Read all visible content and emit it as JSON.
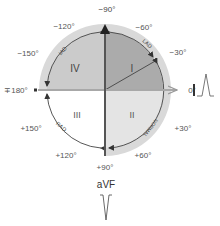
{
  "diagram": {
    "center": {
      "x": 105,
      "y": 90
    },
    "radii": {
      "outer": 66,
      "arc": 58
    },
    "colors": {
      "outer_ring": "#d9d9d9",
      "quadrant_I": "#ababab",
      "quadrant_II": "#e4e4e4",
      "quadrant_III": "#ffffff",
      "quadrant_IV": "#cbcbcb",
      "vertical_axis": "#555555",
      "horizontal_axis": "#a8a8a8",
      "arc": "#444444",
      "text": "#555555"
    },
    "quadrants": [
      {
        "id": "I",
        "label": "I"
      },
      {
        "id": "II",
        "label": "II"
      },
      {
        "id": "III",
        "label": "III"
      },
      {
        "id": "IV",
        "label": "IV"
      }
    ],
    "angle_labels": {
      "m90": "−90°",
      "m60": "−60°",
      "m30": "−30°",
      "zero": "0°",
      "p30": "+30°",
      "p60": "+60°",
      "p90": "+90°",
      "p120": "+120°",
      "p150": "+150°",
      "pm180": "∓180°",
      "m150": "−150°",
      "m120": "−120°"
    },
    "arc_labels": {
      "iad": "IAD",
      "lad": "LAD",
      "normal": "NORMAL",
      "rad": "RAD"
    },
    "leads": {
      "lead_I": "I",
      "avf": "aVF"
    }
  }
}
